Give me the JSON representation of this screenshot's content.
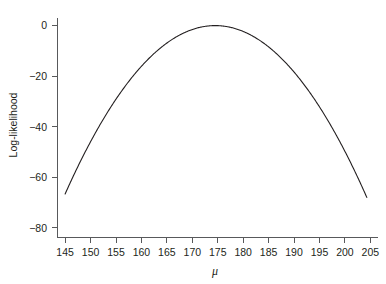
{
  "chart_data": {
    "type": "line",
    "title": "",
    "subtitle": "",
    "xlabel": "μ",
    "ylabel": "Log-likelihood",
    "xlim": [
      143.5,
      206.5
    ],
    "ylim": [
      -84,
      3
    ],
    "grid": false,
    "legend": null,
    "xticks": [
      145,
      150,
      155,
      160,
      165,
      170,
      175,
      180,
      185,
      190,
      195,
      200,
      205
    ],
    "xticklabels": [
      "145",
      "150",
      "155",
      "160",
      "165",
      "170",
      "175",
      "180",
      "185",
      "190",
      "195",
      "200",
      "205"
    ],
    "yticks": [
      0,
      -20,
      -40,
      -60,
      -80
    ],
    "yticklabels": [
      "0",
      "−20",
      "−40",
      "−60",
      "−80"
    ],
    "series": [
      {
        "name": "Log-likelihood",
        "color": "#231f20",
        "peak_x": 174.5,
        "peak_y": 0,
        "x": [
          145.0,
          146.5,
          148.0,
          149.5,
          151.0,
          152.5,
          154.0,
          155.5,
          157.0,
          158.5,
          160.0,
          161.5,
          163.0,
          164.5,
          166.0,
          167.5,
          169.0,
          170.5,
          172.0,
          173.5,
          174.5,
          175.5,
          177.0,
          178.5,
          180.0,
          181.5,
          183.0,
          184.5,
          186.0,
          187.5,
          189.0,
          190.5,
          192.0,
          193.5,
          195.0,
          196.5,
          198.0,
          199.5,
          201.0,
          202.5,
          204.3
        ],
        "y": [
          -67.5,
          -62.6,
          -57.9,
          -53.4,
          -49.1,
          -45.0,
          -41.1,
          -37.4,
          -33.9,
          -30.6,
          -27.5,
          -24.6,
          -21.9,
          -19.4,
          -16.1,
          -13.3,
          -10.8,
          -8.5,
          -6.5,
          -4.7,
          0.0,
          -0.1,
          -0.5,
          -1.2,
          -2.1,
          -3.4,
          -4.9,
          -6.7,
          -8.8,
          -11.2,
          -13.8,
          -16.8,
          -20.0,
          -23.5,
          -27.3,
          -31.4,
          -35.7,
          -40.4,
          -45.3,
          -50.5,
          -65.0
        ],
        "model": {
          "form": "quadratic",
          "equation": "ll = -k * (mu - mu_hat)^2",
          "mu_hat": 174.5,
          "k": 0.0765
        }
      }
    ]
  }
}
